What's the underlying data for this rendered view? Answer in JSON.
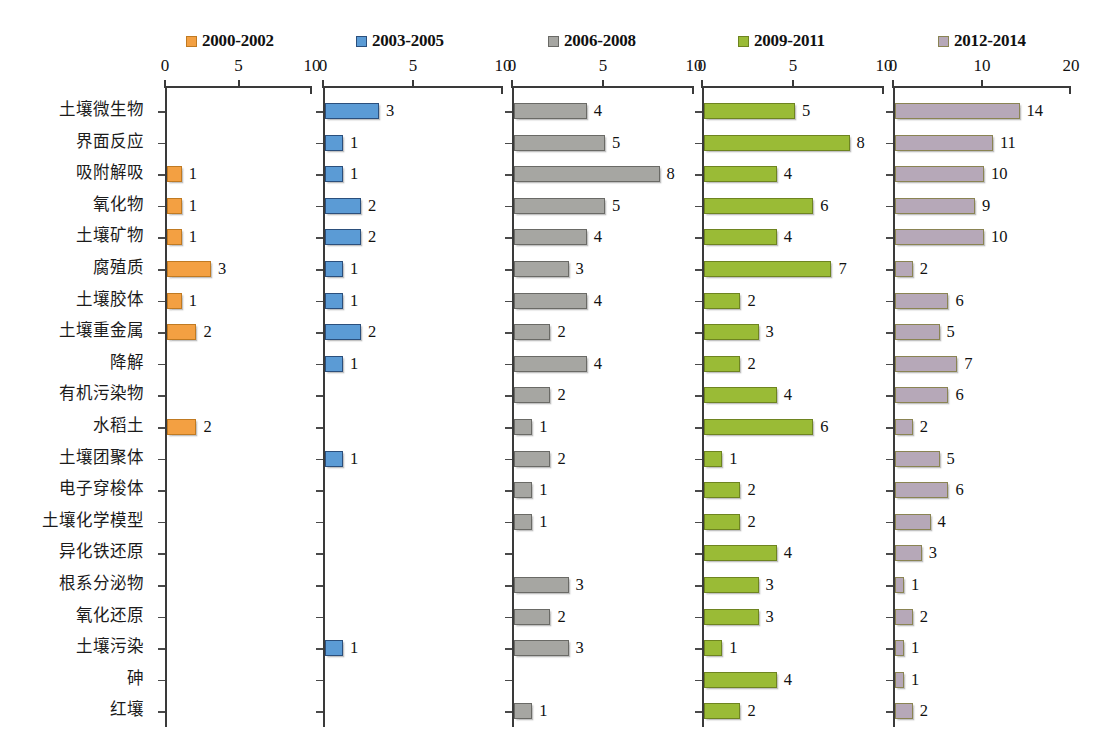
{
  "chart_data": {
    "type": "bar",
    "title": "",
    "xlabel": "",
    "ylabel": "",
    "orientation": "horizontal",
    "grid": false,
    "legend_position": "top",
    "panel_layout": "small-multiples, 5 panels sharing category axis",
    "categories": [
      "土壤微生物",
      "界面反应",
      "吸附解吸",
      "氧化物",
      "土壤矿物",
      "腐殖质",
      "土壤胶体",
      "土壤重金属",
      "降解",
      "有机污染物",
      "水稻土",
      "土壤团聚体",
      "电子穿梭体",
      "土壤化学模型",
      "异化铁还原",
      "根系分泌物",
      "氧化还原",
      "土壤污染",
      "砷",
      "红壤"
    ],
    "series": [
      {
        "name": "2000-2002",
        "color": "#F3A042",
        "border_color": "#C07A22",
        "xlim": [
          0,
          10
        ],
        "xticks": [
          0,
          5,
          10
        ],
        "xtick_labels": [
          "0",
          "5",
          "10"
        ],
        "values": [
          0,
          0,
          1,
          1,
          1,
          3,
          1,
          2,
          0,
          0,
          2,
          0,
          0,
          0,
          0,
          0,
          0,
          0,
          0,
          0
        ]
      },
      {
        "name": "2003-2005",
        "color": "#5B9BD5",
        "border_color": "#2B4F7C",
        "xlim": [
          0,
          10
        ],
        "xticks": [
          0,
          5,
          10
        ],
        "xtick_labels": [
          "0",
          "5",
          "10"
        ],
        "values": [
          3,
          1,
          1,
          2,
          2,
          1,
          1,
          2,
          1,
          0,
          0,
          1,
          0,
          0,
          0,
          0,
          0,
          1,
          0,
          0
        ]
      },
      {
        "name": "2006-2008",
        "color": "#A6A6A2",
        "border_color": "#6A6A66",
        "xlim": [
          0,
          10
        ],
        "xticks": [
          0,
          5,
          10
        ],
        "xtick_labels": [
          "0",
          "5",
          "10"
        ],
        "values": [
          4,
          5,
          8,
          5,
          4,
          3,
          4,
          2,
          4,
          2,
          1,
          2,
          1,
          1,
          0,
          3,
          2,
          3,
          0,
          1
        ]
      },
      {
        "name": "2009-2011",
        "color": "#9ABB36",
        "border_color": "#6E8420",
        "xlim": [
          0,
          10
        ],
        "xticks": [
          0,
          5,
          10
        ],
        "xtick_labels": [
          "0",
          "5",
          "10"
        ],
        "values": [
          5,
          8,
          4,
          6,
          4,
          7,
          2,
          3,
          2,
          4,
          6,
          1,
          2,
          2,
          4,
          3,
          3,
          1,
          4,
          2
        ]
      },
      {
        "name": "2012-2014",
        "color": "#B6A8B8",
        "border_color": "#8A8453",
        "xlim": [
          0,
          20
        ],
        "xticks": [
          0,
          10,
          20
        ],
        "xtick_labels": [
          "0",
          "10",
          "20"
        ],
        "values": [
          14,
          11,
          10,
          9,
          10,
          2,
          6,
          5,
          7,
          6,
          2,
          5,
          6,
          4,
          3,
          1,
          2,
          1,
          1,
          2
        ]
      }
    ]
  }
}
